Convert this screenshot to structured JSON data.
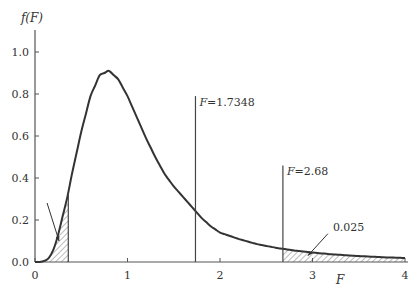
{
  "chart_data": {
    "type": "line",
    "title": "",
    "ylabel": "f(F)",
    "xlabel": "F",
    "xlim": [
      0,
      4
    ],
    "ylim": [
      0,
      1.1
    ],
    "x_ticks": [
      0,
      1,
      2,
      3,
      4
    ],
    "x_tick_labels": [
      "0",
      "1",
      "2",
      "3",
      "4"
    ],
    "y_ticks": [
      0.0,
      0.2,
      0.4,
      0.6,
      0.8,
      1.0
    ],
    "y_tick_labels": [
      "0.0",
      "0.2",
      "0.4",
      "0.6",
      "0.8",
      "1.0"
    ],
    "curve": {
      "name": "F density",
      "x": [
        0,
        0.05,
        0.1,
        0.15,
        0.2,
        0.25,
        0.3,
        0.35,
        0.4,
        0.5,
        0.6,
        0.7,
        0.8,
        0.9,
        1.0,
        1.1,
        1.2,
        1.3,
        1.4,
        1.5,
        1.6,
        1.7,
        1.8,
        1.9,
        2.0,
        2.2,
        2.4,
        2.6,
        2.8,
        3.0,
        3.2,
        3.4,
        3.6,
        3.8,
        4.0
      ],
      "y": [
        0,
        0.0,
        0.005,
        0.02,
        0.06,
        0.13,
        0.22,
        0.31,
        0.42,
        0.62,
        0.79,
        0.89,
        0.91,
        0.87,
        0.79,
        0.69,
        0.59,
        0.5,
        0.42,
        0.36,
        0.31,
        0.26,
        0.21,
        0.17,
        0.14,
        0.11,
        0.085,
        0.068,
        0.055,
        0.045,
        0.037,
        0.031,
        0.026,
        0.022,
        0.019
      ]
    },
    "shaded_regions": [
      {
        "from": 0,
        "to": 0.36,
        "label": ""
      },
      {
        "from": 2.68,
        "to": 4,
        "label": "0.025"
      }
    ],
    "vertical_lines": [
      {
        "x": 0.36,
        "y_top": 0.26,
        "label": ""
      },
      {
        "x": 1.7348,
        "y_top": 0.79,
        "label": "F=1.7348"
      },
      {
        "x": 2.68,
        "y_top": 0.46,
        "label": "F=2.68"
      }
    ],
    "annotations": [
      {
        "text": "0.025",
        "points_to": [
          2.95,
          0.03
        ]
      },
      {
        "text": "",
        "points_to": [
          0.26,
          0.1
        ],
        "note": "arrow to left tail"
      }
    ]
  }
}
